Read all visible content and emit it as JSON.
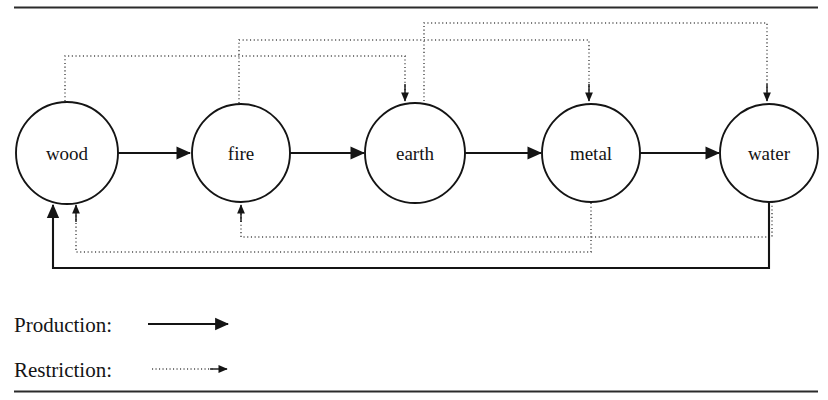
{
  "figure": {
    "type": "cycle-diagram",
    "nodes": [
      {
        "id": "wood",
        "label": "wood",
        "cx": 67,
        "cy": 153,
        "r": 51
      },
      {
        "id": "fire",
        "label": "fire",
        "cx": 241,
        "cy": 153,
        "r": 49
      },
      {
        "id": "earth",
        "label": "earth",
        "cx": 415,
        "cy": 153,
        "r": 50
      },
      {
        "id": "metal",
        "label": "metal",
        "cx": 591,
        "cy": 153,
        "r": 49
      },
      {
        "id": "water",
        "label": "water",
        "cx": 769,
        "cy": 153,
        "r": 49
      }
    ],
    "production_edges": [
      {
        "from": "wood",
        "to": "fire"
      },
      {
        "from": "fire",
        "to": "earth"
      },
      {
        "from": "earth",
        "to": "metal"
      },
      {
        "from": "metal",
        "to": "water"
      },
      {
        "from": "water",
        "to": "wood"
      }
    ],
    "restriction_edges": [
      {
        "from": "wood",
        "to": "earth",
        "route": "top"
      },
      {
        "from": "fire",
        "to": "metal",
        "route": "top"
      },
      {
        "from": "earth",
        "to": "water",
        "route": "top"
      },
      {
        "from": "metal",
        "to": "wood",
        "route": "bottom"
      },
      {
        "from": "water",
        "to": "fire",
        "route": "bottom"
      }
    ],
    "colors": {
      "stroke": "#141414",
      "dotted_stroke": "#4a4a4a",
      "background": "#ffffff",
      "rule": "#2b2b2b"
    }
  },
  "legend": {
    "rows": [
      {
        "id": "production",
        "label": "Production:",
        "style": "solid"
      },
      {
        "id": "restriction",
        "label": "Restriction:",
        "style": "dotted"
      }
    ]
  }
}
